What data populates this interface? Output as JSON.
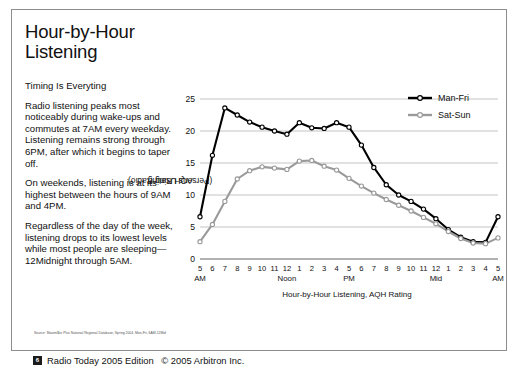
{
  "page": {
    "title": "Hour-by-Hour Listening",
    "subhead": "Timing Is Everyting",
    "paragraphs": [
      "Radio listening peaks most noticeably during wake-ups and commutes at 7AM every weekday. Listening remains strong through 6PM, after which it begins to taper off.",
      "On weekends, listening is at its highest between the hours of 9AM and 4PM.",
      "Regardless of the day of the week, listening drops to its lowest levels while most people are sleeping—12Midnight through 5AM."
    ],
    "source": "Source: Maximi$er Plus National Regional Database, Spring 2004, Mon-Fri, 6AM-12Mid",
    "footer": {
      "page_number": "6",
      "edition": "Radio Today 2005 Edition",
      "copyright": "© 2005 Arbitron Inc."
    }
  },
  "chart_data": {
    "type": "line",
    "title": "",
    "xlabel": "Hour-by-Hour Listening, AQH Rating",
    "ylabel": "AQH Rating\n(Persons Using Radio)",
    "ylabel_line1": "AQH Rating",
    "ylabel_line2": "(Persons Using Radio)",
    "ylim": [
      0,
      25
    ],
    "yticks": [
      0,
      5,
      10,
      15,
      20,
      25
    ],
    "grid": true,
    "legend_position": "top-right",
    "categories": [
      "5",
      "6",
      "7",
      "8",
      "9",
      "10",
      "11",
      "12",
      "1",
      "2",
      "3",
      "4",
      "5",
      "6",
      "7",
      "8",
      "9",
      "10",
      "11",
      "12",
      "1",
      "2",
      "3",
      "4",
      "5"
    ],
    "daypart_labels": [
      "AM",
      "Noon",
      "PM",
      "Mid",
      "AM"
    ],
    "daypart_label_index": [
      0,
      7,
      12,
      19,
      24
    ],
    "series": [
      {
        "name": "Man-Fri",
        "color": "#000000",
        "values": [
          6.6,
          16.2,
          23.6,
          22.5,
          21.4,
          20.6,
          20.0,
          19.5,
          21.3,
          20.5,
          20.4,
          21.3,
          20.6,
          17.8,
          14.3,
          11.6,
          10.0,
          9.0,
          7.8,
          6.3,
          4.6,
          3.4,
          2.7,
          2.6,
          6.6
        ]
      },
      {
        "name": "Sat-Sun",
        "color": "#9a9a9a",
        "values": [
          2.7,
          5.4,
          9.0,
          12.5,
          13.8,
          14.4,
          14.2,
          14.0,
          15.3,
          15.4,
          14.5,
          13.9,
          12.6,
          11.4,
          10.3,
          9.3,
          8.4,
          7.5,
          6.5,
          5.5,
          4.3,
          3.2,
          2.5,
          2.4,
          3.3
        ]
      }
    ]
  }
}
